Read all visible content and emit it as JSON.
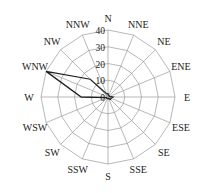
{
  "chart_data": {
    "type": "radar",
    "title": "",
    "categories": [
      "N",
      "NNE",
      "NE",
      "ENE",
      "E",
      "ESE",
      "SE",
      "SSE",
      "S",
      "SSW",
      "SW",
      "WSW",
      "W",
      "WNW",
      "NW",
      "NNW"
    ],
    "series": [
      {
        "name": "frequency",
        "values": [
          2,
          1,
          1,
          1,
          3,
          2,
          2,
          1,
          1,
          1,
          1,
          1,
          16,
          40,
          15,
          2
        ]
      }
    ],
    "radial_ticks": [
      0,
      10,
      20,
      30,
      40
    ],
    "rlim": [
      0,
      40
    ],
    "grid": true,
    "legend": "none"
  },
  "colors": {
    "grid": "#9a9a9a",
    "series": "#222222",
    "text": "#222222"
  }
}
